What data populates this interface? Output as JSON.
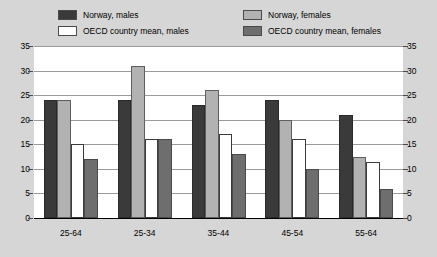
{
  "legend": {
    "items": [
      {
        "key": "norway-males",
        "label": "Norway, males",
        "color": "#3a3a3a"
      },
      {
        "key": "oecd-males",
        "label": "OECD country mean, males",
        "color": "#ffffff"
      },
      {
        "key": "norway-females",
        "label": "Norway, females",
        "color": "#b2b2b2"
      },
      {
        "key": "oecd-females",
        "label": "OECD country mean, females",
        "color": "#6e6e6e"
      }
    ]
  },
  "axis": {
    "left_ticks": [
      "35",
      "30",
      "25",
      "20",
      "15",
      "10",
      "5",
      "0"
    ],
    "right_ticks": [
      "35",
      "30",
      "25",
      "20",
      "15",
      "10",
      "5",
      "0"
    ]
  },
  "chart_data": {
    "type": "bar",
    "title": "",
    "xlabel": "",
    "ylabel": "",
    "ylim": [
      0,
      35
    ],
    "ytick_step": 5,
    "grid": true,
    "legend_position": "top",
    "dual_y_axis": true,
    "categories": [
      "25-64",
      "25-34",
      "35-44",
      "45-54",
      "55-64"
    ],
    "series": [
      {
        "name": "Norway, males",
        "color": "#3a3a3a",
        "values": [
          24,
          24,
          23,
          24,
          21
        ]
      },
      {
        "name": "Norway, females",
        "color": "#b2b2b2",
        "values": [
          24,
          31,
          26,
          20,
          12.5
        ]
      },
      {
        "name": "OECD country mean, males",
        "color": "#ffffff",
        "values": [
          15,
          16,
          17,
          16,
          11.5
        ]
      },
      {
        "name": "OECD country mean, females",
        "color": "#6e6e6e",
        "values": [
          12,
          16,
          13,
          10,
          6
        ]
      }
    ]
  }
}
